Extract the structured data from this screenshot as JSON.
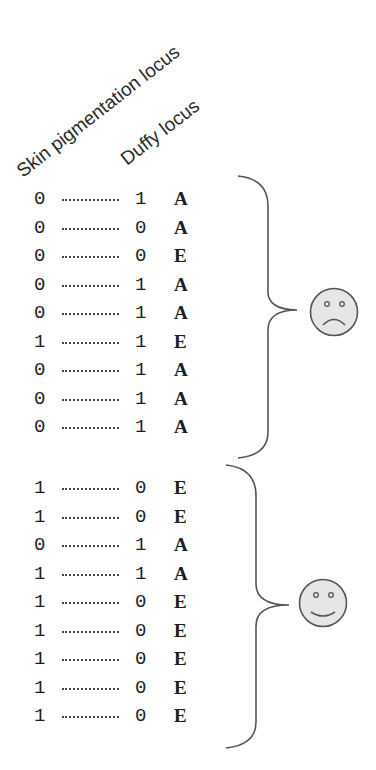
{
  "headers": {
    "skin_pigmentation": "Skin pigmentation locus",
    "duffy": "Duffy locus"
  },
  "groups": [
    {
      "face": "sad-face",
      "rows": [
        {
          "skin": "0",
          "duffy": "1",
          "allele": "A"
        },
        {
          "skin": "0",
          "duffy": "0",
          "allele": "A"
        },
        {
          "skin": "0",
          "duffy": "0",
          "allele": "E"
        },
        {
          "skin": "0",
          "duffy": "1",
          "allele": "A"
        },
        {
          "skin": "0",
          "duffy": "1",
          "allele": "A"
        },
        {
          "skin": "1",
          "duffy": "1",
          "allele": "E"
        },
        {
          "skin": "0",
          "duffy": "1",
          "allele": "A"
        },
        {
          "skin": "0",
          "duffy": "1",
          "allele": "A"
        },
        {
          "skin": "0",
          "duffy": "1",
          "allele": "A"
        }
      ]
    },
    {
      "face": "happy-face",
      "rows": [
        {
          "skin": "1",
          "duffy": "0",
          "allele": "E"
        },
        {
          "skin": "1",
          "duffy": "0",
          "allele": "E"
        },
        {
          "skin": "0",
          "duffy": "1",
          "allele": "A"
        },
        {
          "skin": "1",
          "duffy": "1",
          "allele": "A"
        },
        {
          "skin": "1",
          "duffy": "0",
          "allele": "E"
        },
        {
          "skin": "1",
          "duffy": "0",
          "allele": "E"
        },
        {
          "skin": "1",
          "duffy": "0",
          "allele": "E"
        },
        {
          "skin": "1",
          "duffy": "0",
          "allele": "E"
        },
        {
          "skin": "1",
          "duffy": "0",
          "allele": "E"
        }
      ]
    }
  ],
  "colors": {
    "ink": "#1e1e1e",
    "brace": "#555555",
    "face_fill": "#e6e6e6",
    "face_stroke": "#555555"
  }
}
